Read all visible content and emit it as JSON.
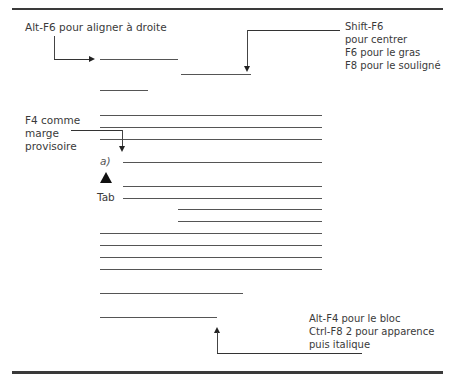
{
  "annotations": {
    "align_right": "Alt-F6 pour aligner à droite",
    "center_lines": [
      "Shift-F6",
      "pour centrer",
      "F6 pour le gras",
      "F8 pour le souligné"
    ],
    "margin_lines": [
      "F4 comme",
      "marge",
      "provisoire"
    ],
    "block_lines": [
      "Alt-F4 pour le bloc",
      "Ctrl-F8 2 pour apparence",
      "puis italique"
    ]
  },
  "labels": {
    "list_marker": "a)",
    "tab_label": "Tab"
  },
  "icons": {
    "tab_marker": "up-triangle-icon"
  }
}
